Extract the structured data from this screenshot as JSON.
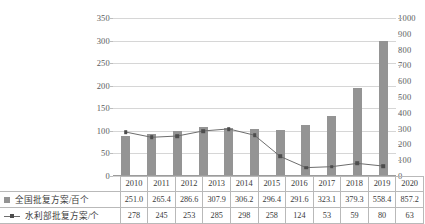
{
  "chart_data": {
    "type": "bar",
    "title": "",
    "subtitle": "",
    "xlabel": "",
    "ylabel": "",
    "grid": true,
    "legend_position": "bottom-table",
    "categories": [
      "2010",
      "2011",
      "2012",
      "2013",
      "2014",
      "2015",
      "2016",
      "2017",
      "2018",
      "2019",
      "2020"
    ],
    "axes": {
      "left": {
        "label": "",
        "ticks": [
          0,
          50,
          100,
          150,
          200,
          250,
          300,
          350
        ],
        "tick_labels": [
          "0",
          "50",
          "100",
          "150",
          "200",
          "250",
          "300",
          "350"
        ],
        "ylim": [
          0,
          350
        ]
      },
      "right": {
        "label": "",
        "ticks": [
          0,
          100,
          200,
          300,
          400,
          500,
          600,
          700,
          800,
          900,
          1000
        ],
        "tick_labels": [
          "0",
          "100",
          "200",
          "300",
          "400",
          "500",
          "600",
          "700",
          "800",
          "900",
          "1000"
        ],
        "ylim": [
          0,
          1000
        ]
      }
    },
    "series": [
      {
        "name": "全国批复方案/百个",
        "type": "bar",
        "axis": "right",
        "color": "#949494",
        "marker": "square",
        "values": [
          251.0,
          265.4,
          286.6,
          307.9,
          306.2,
          296.4,
          291.6,
          323.1,
          379.3,
          558.4,
          857.2
        ],
        "value_labels": [
          "251.0",
          "265.4",
          "286.6",
          "307.9",
          "306.2",
          "296.4",
          "291.6",
          "323.1",
          "379.3",
          "558.4",
          "857.2"
        ]
      },
      {
        "name": "水利部批复方案/个",
        "type": "line",
        "axis": "right",
        "color": "#6d6d6d",
        "marker": "square",
        "values": [
          278,
          245,
          253,
          285,
          298,
          258,
          124,
          53,
          59,
          80,
          63
        ],
        "value_labels": [
          "278",
          "245",
          "253",
          "285",
          "298",
          "258",
          "124",
          "53",
          "59",
          "80",
          "63"
        ]
      }
    ]
  }
}
